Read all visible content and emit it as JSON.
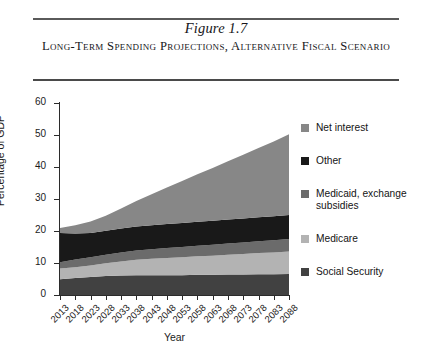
{
  "figure": {
    "number": "Figure 1.7",
    "title": "Long-Term Spending Projections, Alternative Fiscal Scenario"
  },
  "chart_data": {
    "type": "area",
    "stacked": true,
    "title": "Long-Term Spending Projections, Alternative Fiscal Scenario",
    "xlabel": "Year",
    "ylabel": "Percentage of GDP",
    "ylim": [
      0,
      60
    ],
    "yticks": [
      0,
      10,
      20,
      30,
      40,
      50,
      60
    ],
    "grid": false,
    "legend_position": "right",
    "x": [
      2013,
      2018,
      2023,
      2028,
      2033,
      2038,
      2043,
      2048,
      2053,
      2058,
      2063,
      2068,
      2073,
      2078,
      2083,
      2088
    ],
    "categories": [
      "2013",
      "2018",
      "2023",
      "2028",
      "2033",
      "2038",
      "2043",
      "2048",
      "2053",
      "2058",
      "2063",
      "2068",
      "2073",
      "2078",
      "2083",
      "2088"
    ],
    "series": [
      {
        "name": "Social Security",
        "color": "#414141",
        "values": [
          4.9,
          5.3,
          5.6,
          5.9,
          6.1,
          6.2,
          6.2,
          6.2,
          6.2,
          6.3,
          6.3,
          6.4,
          6.4,
          6.5,
          6.5,
          6.6
        ]
      },
      {
        "name": "Medicare",
        "color": "#b3b3b3",
        "values": [
          3.4,
          3.4,
          3.6,
          4.0,
          4.4,
          4.8,
          5.1,
          5.4,
          5.6,
          5.8,
          6.0,
          6.2,
          6.4,
          6.6,
          6.8,
          7.0
        ]
      },
      {
        "name": "Medicaid, exchange subsidies",
        "color": "#6b6b6b",
        "values": [
          1.9,
          2.4,
          2.6,
          2.7,
          2.8,
          2.9,
          3.0,
          3.1,
          3.2,
          3.3,
          3.4,
          3.5,
          3.6,
          3.7,
          3.8,
          3.9
        ]
      },
      {
        "name": "Other",
        "color": "#191919",
        "values": [
          9.2,
          8.1,
          7.6,
          7.5,
          7.5,
          7.5,
          7.5,
          7.5,
          7.5,
          7.5,
          7.5,
          7.5,
          7.5,
          7.5,
          7.5,
          7.5
        ]
      },
      {
        "name": "Net interest",
        "color": "#878787",
        "values": [
          1.5,
          2.6,
          3.6,
          4.7,
          6.2,
          8.0,
          9.7,
          11.4,
          13.1,
          14.8,
          16.5,
          18.2,
          19.9,
          21.6,
          23.4,
          25.2
        ]
      }
    ],
    "totals": [
      20.9,
      21.8,
      23.0,
      24.8,
      27.0,
      29.4,
      31.5,
      33.6,
      35.6,
      37.7,
      39.7,
      41.8,
      43.8,
      45.9,
      48.0,
      50.2
    ],
    "legend_entries": [
      {
        "label": "Net interest",
        "color": "#878787"
      },
      {
        "label": "Other",
        "color": "#191919"
      },
      {
        "label": "Medicaid, exchange\nsubsidies",
        "color": "#6b6b6b"
      },
      {
        "label": "Medicare",
        "color": "#b3b3b3"
      },
      {
        "label": "Social Security",
        "color": "#414141"
      }
    ]
  }
}
